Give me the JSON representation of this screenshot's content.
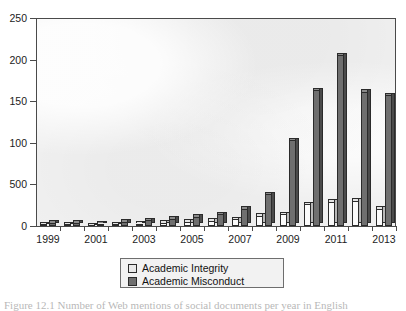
{
  "chart_data": {
    "type": "bar",
    "title": "",
    "subtitle": "",
    "xlabel": "",
    "ylabel": "",
    "grid": false,
    "legend_position": "bottom-center",
    "ylim": [
      0,
      250
    ],
    "ytick_labels": [
      "250",
      "200",
      "150",
      "100",
      "500",
      "0"
    ],
    "ytick_values": [
      250,
      200,
      150,
      100,
      50,
      0
    ],
    "categories": [
      "1999",
      "2000",
      "2001",
      "2002",
      "2003",
      "2004",
      "2005",
      "2006",
      "2007",
      "2008",
      "2009",
      "2010",
      "2011",
      "2012",
      "2013"
    ],
    "xtick_labels_shown": [
      "1999",
      "2001",
      "2003",
      "2005",
      "2007",
      "2009",
      "2011",
      "2013"
    ],
    "series": [
      {
        "name": "Academic Integrity",
        "color": "#e9e9e9",
        "values": [
          2,
          2,
          1,
          2,
          3,
          4,
          5,
          6,
          8,
          12,
          14,
          26,
          29,
          30,
          21
        ]
      },
      {
        "name": "Academic Misconduct",
        "color": "#6f6f6f",
        "values": [
          4,
          4,
          3,
          5,
          7,
          9,
          11,
          14,
          21,
          38,
          103,
          163,
          205,
          161,
          157
        ]
      }
    ]
  },
  "legend": {
    "entries": [
      {
        "label": "Academic Integrity"
      },
      {
        "label": "Academic Misconduct"
      }
    ]
  },
  "caption": {
    "text": "Figure 12.1 Number of Web mentions of social documents per year in English"
  }
}
